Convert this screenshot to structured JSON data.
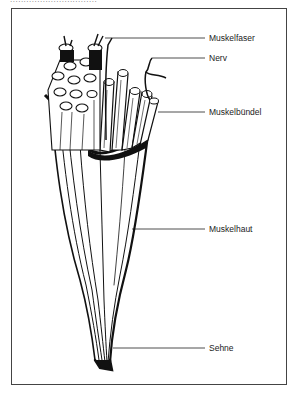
{
  "header": {
    "cutoff_text": "................................"
  },
  "diagram": {
    "title": "",
    "labels": [
      {
        "id": "muskelfaser",
        "text": "Muskelfaser",
        "x": 209,
        "y": 33
      },
      {
        "id": "nerv",
        "text": "Nerv",
        "x": 209,
        "y": 53
      },
      {
        "id": "muskelbuendel",
        "text": "Muskelbündel",
        "x": 209,
        "y": 107
      },
      {
        "id": "muskelhaut",
        "text": "Muskelhaut",
        "x": 209,
        "y": 224
      },
      {
        "id": "sehne",
        "text": "Sehne",
        "x": 209,
        "y": 343
      }
    ]
  }
}
